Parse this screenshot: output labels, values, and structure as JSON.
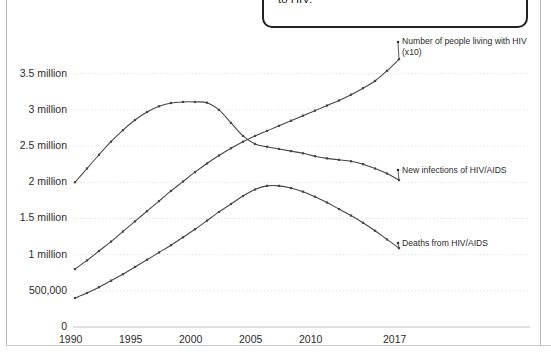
{
  "callout": {
    "line1": "...zant of risky behaviors that can expose you",
    "line2": "to HIV."
  },
  "chart_data": {
    "type": "line",
    "title": "",
    "subtitle": "",
    "xlabel": "",
    "ylabel": "",
    "grid": true,
    "legend_position": "right-inline",
    "xlim": [
      1990,
      2017
    ],
    "ylim": [
      0,
      3800000
    ],
    "x_ticks": [
      "1990",
      "1995",
      "2000",
      "2005",
      "2010",
      "2017"
    ],
    "x_tick_values": [
      1990,
      1995,
      2000,
      2005,
      2010,
      2017
    ],
    "y_ticks": [
      "0",
      "500,000",
      "1 million",
      "1.5 million",
      "2 million",
      "2.5 million",
      "3 million",
      "3.5 million"
    ],
    "y_tick_values": [
      0,
      500000,
      1000000,
      1500000,
      2000000,
      2500000,
      3000000,
      3500000
    ],
    "x": [
      1990,
      1991,
      1992,
      1993,
      1994,
      1995,
      1996,
      1997,
      1998,
      1999,
      2000,
      2001,
      2002,
      2003,
      2004,
      2005,
      2006,
      2007,
      2008,
      2009,
      2010,
      2011,
      2012,
      2013,
      2014,
      2015,
      2016,
      2017
    ],
    "series": [
      {
        "name": "Number of people living with HIV (x10)",
        "label_line1": "Number of people living with HIV",
        "label_line2": "(x10)",
        "color": "#444444",
        "values": [
          800000,
          920000,
          1050000,
          1180000,
          1320000,
          1460000,
          1600000,
          1740000,
          1880000,
          2010000,
          2140000,
          2260000,
          2370000,
          2470000,
          2560000,
          2640000,
          2710000,
          2780000,
          2850000,
          2920000,
          2990000,
          3060000,
          3130000,
          3210000,
          3300000,
          3400000,
          3540000,
          3700000
        ]
      },
      {
        "name": "New infections of HIV/AIDS",
        "label_line1": "New infections of HIV/AIDS",
        "label_line2": "",
        "color": "#444444",
        "values": [
          2000000,
          2190000,
          2380000,
          2560000,
          2720000,
          2860000,
          2970000,
          3050000,
          3095000,
          3110000,
          3110000,
          3100000,
          3000000,
          2820000,
          2640000,
          2530000,
          2490000,
          2460000,
          2430000,
          2400000,
          2360000,
          2330000,
          2310000,
          2290000,
          2250000,
          2190000,
          2120000,
          2030000
        ]
      },
      {
        "name": "Deaths from HIV/AIDS",
        "label_line1": "Deaths from HIV/AIDS",
        "label_line2": "",
        "color": "#444444",
        "values": [
          400000,
          470000,
          550000,
          640000,
          730000,
          830000,
          930000,
          1030000,
          1130000,
          1240000,
          1350000,
          1470000,
          1590000,
          1700000,
          1810000,
          1900000,
          1950000,
          1950000,
          1920000,
          1870000,
          1800000,
          1720000,
          1630000,
          1540000,
          1440000,
          1330000,
          1210000,
          1090000
        ]
      }
    ]
  }
}
